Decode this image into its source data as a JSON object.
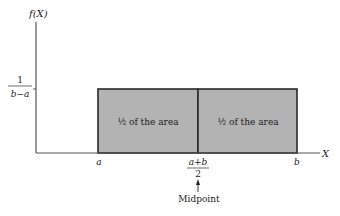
{
  "diagram": {
    "type": "uniform-distribution",
    "y_axis_label": "f(X)",
    "x_axis_label": "X",
    "y_tick": {
      "numerator": "1",
      "denominator": "b−a"
    },
    "x_ticks": {
      "left": "a",
      "right": "b",
      "mid_numerator": "a+b",
      "mid_denominator": "2"
    },
    "regions": [
      {
        "label": "½ of the area"
      },
      {
        "label": "½ of the area"
      }
    ],
    "annotation": "Midpoint",
    "colors": {
      "fill": "#b3b3b3",
      "stroke": "#2a2a2a",
      "axis": "#555555"
    }
  }
}
